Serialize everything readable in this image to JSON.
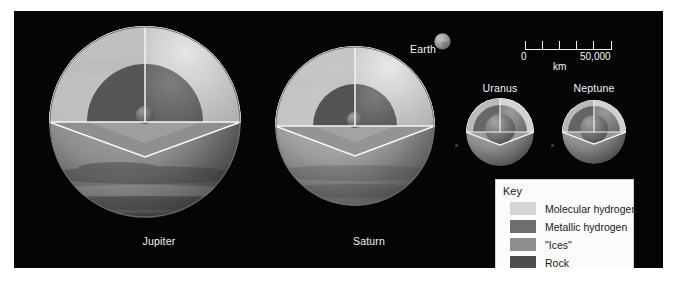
{
  "figure": {
    "background_color": "#050505",
    "frame_color": "#ffffff"
  },
  "colors": {
    "molecular_hydrogen": "#d4d4d4",
    "metallic_hydrogen": "#6f6f6f",
    "ices": "#8e8e8e",
    "rock": "#4d4d4d",
    "cut_face_light": "#cfcfcf",
    "cut_face_mid": "#9a9a9a",
    "outline": "#f2f2f2",
    "label_text": "#f2f2f2",
    "key_text": "#1a1a1a",
    "key_background": "#fbfbfb"
  },
  "planets": [
    {
      "name": "Jupiter",
      "label": "Jupiter",
      "center_x": 145,
      "center_y": 122,
      "radius": 97,
      "core_radius": 9,
      "metallic_radius": 58,
      "label_x": 145,
      "label_y": 231,
      "banded": true
    },
    {
      "name": "Saturn",
      "label": "Saturn",
      "center_x": 355,
      "center_y": 126,
      "radius": 81,
      "core_radius": 8,
      "metallic_radius": 42,
      "label_x": 355,
      "label_y": 231,
      "banded": true
    },
    {
      "name": "Uranus",
      "label": "Uranus",
      "center_x": 500,
      "center_y": 132,
      "radius": 35,
      "core_radius": 15,
      "metallic_radius": 27,
      "label_x": 500,
      "label_y": 78,
      "banded": false
    },
    {
      "name": "Neptune",
      "label": "Neptune",
      "center_x": 594,
      "center_y": 132,
      "radius": 33,
      "core_radius": 14,
      "metallic_radius": 26,
      "label_x": 594,
      "label_y": 78,
      "banded": false
    }
  ],
  "earth": {
    "label": "Earth",
    "center_x": 442,
    "center_y": 41,
    "radius": 8.5
  },
  "scalebar": {
    "min_label": "0",
    "max_label": "50,000",
    "units_label": "km",
    "min_value": 0,
    "max_value": 50000,
    "divisions": 5,
    "tick_values": [
      0,
      10000,
      20000,
      30000,
      40000,
      50000
    ]
  },
  "key": {
    "title": "Key",
    "items": [
      {
        "label": "Molecular hydrogen",
        "color": "#d4d4d4"
      },
      {
        "label": "Metallic hydrogen",
        "color": "#6f6f6f"
      },
      {
        "label": "\"Ices\"",
        "color": "#8e8e8e"
      },
      {
        "label": "Rock",
        "color": "#4d4d4d"
      }
    ]
  }
}
